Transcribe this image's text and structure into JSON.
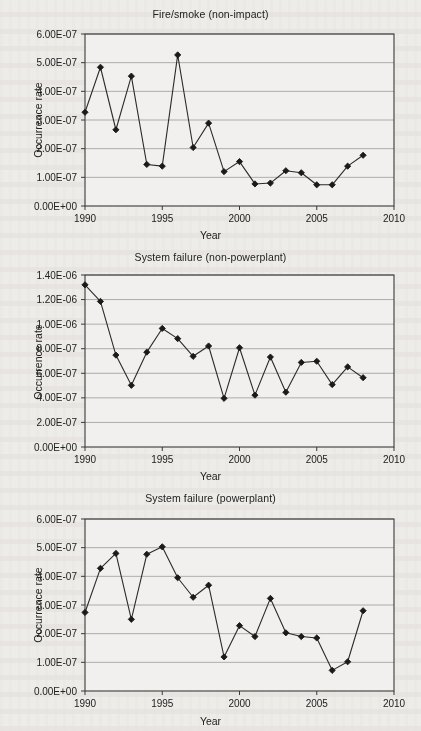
{
  "figure": {
    "background_color": "#eeece9",
    "line_color": "#2b2b2b",
    "marker_color": "#1a1a1a",
    "grid_color": "#9a9a9a",
    "frame_color": "#3a3a3a"
  },
  "charts": [
    {
      "title": "Fire/smoke (non-impact)",
      "xlabel": "Year",
      "ylabel": "Occurrence rate",
      "ytick_labels": [
        "0.00E+00",
        "1.00E-07",
        "2.00E-07",
        "3.00E-07",
        "4.00E-07",
        "5.00E-07",
        "6.00E-07"
      ],
      "xtick_labels": [
        "1990",
        "1995",
        "2000",
        "2005",
        "2010"
      ]
    },
    {
      "title": "System failure (non-powerplant)",
      "xlabel": "Year",
      "ylabel": "Occurrence rate",
      "ytick_labels": [
        "0.00E+00",
        "2.00E-07",
        "4.00E-07",
        "6.00E-07",
        "8.00E-07",
        "1.00E-06",
        "1.20E-06",
        "1.40E-06"
      ],
      "xtick_labels": [
        "1990",
        "1995",
        "2000",
        "2005",
        "2010"
      ]
    },
    {
      "title": "System failure (powerplant)",
      "xlabel": "Year",
      "ylabel": "Occurrence rate",
      "ytick_labels": [
        "0.00E+00",
        "1.00E-07",
        "2.00E-07",
        "3.00E-07",
        "4.00E-07",
        "5.00E-07",
        "6.00E-07"
      ],
      "xtick_labels": [
        "1990",
        "1995",
        "2000",
        "2005",
        "2010"
      ]
    }
  ],
  "chart_data": [
    {
      "type": "line",
      "title": "Fire/smoke (non-impact)",
      "xlabel": "Year",
      "ylabel": "Occurrence rate",
      "xlim": [
        1990,
        2010
      ],
      "ylim": [
        0,
        6e-07
      ],
      "ytick_values": [
        0,
        1e-07,
        2e-07,
        3e-07,
        4e-07,
        5e-07,
        6e-07
      ],
      "xtick_values": [
        1990,
        1995,
        2000,
        2005,
        2010
      ],
      "grid": "horizontal",
      "legend": "none",
      "marker": "diamond",
      "x": [
        1990,
        1991,
        1992,
        1993,
        1994,
        1995,
        1996,
        1997,
        1998,
        1999,
        2000,
        2001,
        2002,
        2003,
        2004,
        2005,
        2006,
        2007,
        2008
      ],
      "values": [
        3.27e-07,
        4.84e-07,
        2.66e-07,
        4.53e-07,
        1.45e-07,
        1.39e-07,
        5.27e-07,
        2.04e-07,
        2.89e-07,
        1.2e-07,
        1.55e-07,
        7.7e-08,
        8e-08,
        1.23e-07,
        1.16e-07,
        7.4e-08,
        7.4e-08,
        1.39e-07,
        1.77e-07
      ]
    },
    {
      "type": "line",
      "title": "System failure (non-powerplant)",
      "xlabel": "Year",
      "ylabel": "Occurrence rate",
      "xlim": [
        1990,
        2010
      ],
      "ylim": [
        0,
        1.4e-06
      ],
      "ytick_values": [
        0,
        2e-07,
        4e-07,
        6e-07,
        8e-07,
        1e-06,
        1.2e-06,
        1.4e-06
      ],
      "xtick_values": [
        1990,
        1995,
        2000,
        2005,
        2010
      ],
      "grid": "horizontal",
      "legend": "none",
      "marker": "diamond",
      "x": [
        1990,
        1991,
        1992,
        1993,
        1994,
        1995,
        1996,
        1997,
        1998,
        1999,
        2000,
        2001,
        2002,
        2003,
        2004,
        2005,
        2006,
        2007,
        2008
      ],
      "values": [
        1.32e-06,
        1.185e-06,
        7.48e-07,
        5.02e-07,
        7.72e-07,
        9.65e-07,
        8.82e-07,
        7.38e-07,
        8.22e-07,
        3.96e-07,
        8.08e-07,
        4.22e-07,
        7.32e-07,
        4.46e-07,
        6.88e-07,
        6.98e-07,
        5.08e-07,
        6.52e-07,
        5.64e-07
      ]
    },
    {
      "type": "line",
      "title": "System failure (powerplant)",
      "xlabel": "Year",
      "ylabel": "Occurrence rate",
      "xlim": [
        1990,
        2010
      ],
      "ylim": [
        0,
        6e-07
      ],
      "ytick_values": [
        0,
        1e-07,
        2e-07,
        3e-07,
        4e-07,
        5e-07,
        6e-07
      ],
      "xtick_values": [
        1990,
        1995,
        2000,
        2005,
        2010
      ],
      "grid": "horizontal",
      "legend": "none",
      "marker": "diamond",
      "x": [
        1990,
        1991,
        1992,
        1993,
        1994,
        1995,
        1996,
        1997,
        1998,
        1999,
        2000,
        2001,
        2002,
        2003,
        2004,
        2005,
        2006,
        2007,
        2008
      ],
      "values": [
        2.74e-07,
        4.28e-07,
        4.8e-07,
        2.5e-07,
        4.77e-07,
        5.03e-07,
        3.95e-07,
        3.27e-07,
        3.69e-07,
        1.19e-07,
        2.28e-07,
        1.9e-07,
        3.23e-07,
        2.03e-07,
        1.9e-07,
        1.85e-07,
        7.2e-08,
        1.02e-07,
        2.8e-07
      ]
    }
  ]
}
